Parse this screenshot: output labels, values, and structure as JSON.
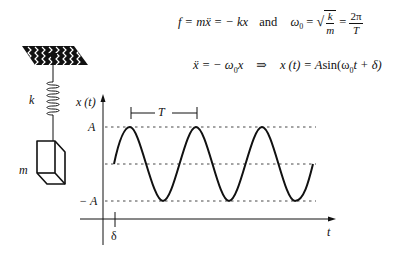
{
  "equations": {
    "line1": {
      "force": "f = mẍ = − kx",
      "conjunction": "and",
      "omega_lhs": "ω",
      "omega_sub": "0",
      "eq_sign": "=",
      "sqrt_num": "k",
      "sqrt_den": "m",
      "eq_sign2": "=",
      "frac_num": "2π",
      "frac_den": "T"
    },
    "line2": {
      "ode_lhs": "ẍ = − ω",
      "ode_sub": "0",
      "ode_rhs": "x",
      "implies": "⇒",
      "solution_lhs": "x (t) = A",
      "sin": "sin(ω",
      "sol_sub": "0",
      "sol_rest": "t + δ)"
    }
  },
  "oscillator": {
    "spring_label": "k",
    "mass_label": "m",
    "icons": [
      "ceiling-hatch-icon",
      "spring-icon",
      "mass-block-icon"
    ]
  },
  "graph": {
    "y_axis_label": "x (t)",
    "x_axis_label": "t",
    "amplitude_label": "A",
    "neg_amplitude_label": "− A",
    "period_label": "T",
    "phase_label": "δ"
  },
  "colors": {
    "ink": "#111111",
    "background": "#ffffff"
  }
}
